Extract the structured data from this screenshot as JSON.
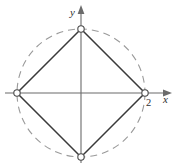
{
  "figure": {
    "background_color": "#ffffff"
  },
  "axes": {
    "x_axis": {
      "name": "x-axis",
      "label": "x",
      "color": "#6b6b6b",
      "start": [
        5,
        93
      ],
      "end": [
        172,
        93
      ],
      "arrow": "right"
    },
    "y_axis": {
      "name": "y-axis",
      "label": "y",
      "color": "#6b6b6b",
      "start": [
        81,
        163
      ],
      "end": [
        81,
        5
      ],
      "arrow": "up"
    },
    "origin": [
      81,
      93
    ]
  },
  "ticks": [
    {
      "label": "2",
      "axis": "x",
      "value": 2,
      "pixel": [
        148,
        102
      ]
    }
  ],
  "chart_data": {
    "type": "scatter",
    "xlabel": "x",
    "ylabel": "y",
    "grid": false,
    "legend": false,
    "xlim": [
      -2.4,
      2.8
    ],
    "ylim": [
      -2.4,
      2.8
    ],
    "tick_labels_x": [
      "2"
    ],
    "tick_labels_y": [],
    "shapes": [
      {
        "name": "dashed-circle",
        "type": "circle",
        "center": [
          0,
          0
        ],
        "radius": 2,
        "style": "dashed",
        "color": "#9a9a9a"
      },
      {
        "name": "inscribed-square",
        "type": "polygon",
        "closed": true,
        "style": "solid",
        "color": "#3a3a3a",
        "points": [
          [
            0,
            2
          ],
          [
            2,
            0
          ],
          [
            0,
            -2
          ],
          [
            -2,
            0
          ]
        ]
      }
    ],
    "vertices": [
      {
        "name": "top-vertex",
        "x": 0,
        "y": 2,
        "marker": "open-circle"
      },
      {
        "name": "right-vertex",
        "x": 2,
        "y": 0,
        "marker": "open-circle"
      },
      {
        "name": "bottom-vertex",
        "x": 0,
        "y": -2,
        "marker": "open-circle"
      },
      {
        "name": "left-vertex",
        "x": -2,
        "y": 0,
        "marker": "open-circle"
      }
    ]
  },
  "geometry_px": {
    "center": [
      81,
      93
    ],
    "radius": 64,
    "vertex_top": [
      81,
      29
    ],
    "vertex_right": [
      145,
      93
    ],
    "vertex_bottom": [
      81,
      157
    ],
    "vertex_left": [
      17,
      93
    ],
    "marker_radius": 3.2
  }
}
